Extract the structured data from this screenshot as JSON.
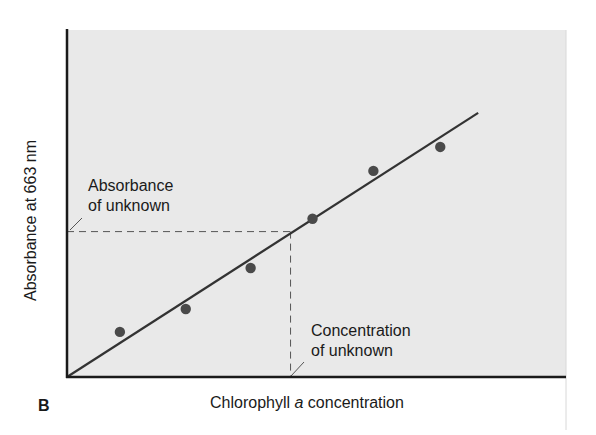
{
  "chart_data": {
    "type": "scatter",
    "title": "",
    "panel_label": "B",
    "xlabel": "Chlorophyll a concentration",
    "xlabel_parts": {
      "before": "Chlorophyll ",
      "italic": "a",
      "after": " concentration"
    },
    "ylabel": "Absorbance at 663 nm",
    "xlim": [
      0,
      10
    ],
    "ylim": [
      0,
      10
    ],
    "grid": false,
    "legend": null,
    "series": [
      {
        "name": "Standards",
        "kind": "points",
        "x": [
          1.06,
          2.38,
          3.68,
          4.92,
          6.14,
          7.48
        ],
        "y": [
          1.3,
          1.96,
          3.14,
          4.56,
          5.94,
          6.63
        ]
      },
      {
        "name": "Best-fit line",
        "kind": "line",
        "x": [
          0,
          8.24
        ],
        "y": [
          0,
          7.61
        ]
      }
    ],
    "annotations": [
      {
        "text_line1": "Absorbance",
        "text_line2": "of unknown",
        "target": "y-axis",
        "value_y": 4.19
      },
      {
        "text_line1": "Concentration",
        "text_line2": "of unknown",
        "target": "x-axis",
        "value_x": 4.48
      }
    ],
    "unknown": {
      "x": 4.48,
      "y": 4.19
    }
  },
  "colors": {
    "plot_bg": "#e9e9e9",
    "axis": "#1a1a1a",
    "line": "#333333",
    "points": "#4a4a4a",
    "dashes": "#555555"
  }
}
